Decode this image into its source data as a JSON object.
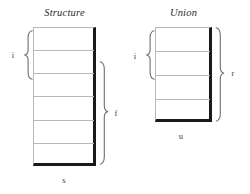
{
  "figure": {
    "kind": "schematic-diagram",
    "background_color": "#ffffff",
    "line_color": "#b9b9b9",
    "edge_color": "#1a1a1a",
    "brace_color": "#6e6e6e"
  },
  "panels": [
    {
      "id": "structure",
      "title": "Structure",
      "rows": 6,
      "left_brace_label": "i",
      "right_brace_label": "f",
      "bottom_label": "s"
    },
    {
      "id": "union",
      "title": "Union",
      "rows": 4,
      "left_brace_label": "i",
      "right_brace_label": "r",
      "bottom_label": "u"
    }
  ],
  "labels": {
    "structure_i": "i",
    "structure_f": "f",
    "structure_s": "s",
    "union_i": "i",
    "union_r": "r",
    "union_u": "u"
  }
}
